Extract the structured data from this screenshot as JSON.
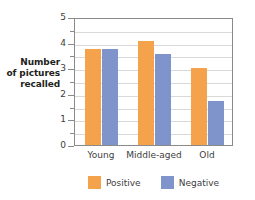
{
  "chart_data": {
    "type": "bar",
    "title": "",
    "xlabel": "",
    "ylabel": "Number of pictures recalled",
    "ylabel_lines": [
      "Number",
      "of pictures",
      "recalled"
    ],
    "categories": [
      "Young",
      "Middle-aged",
      "Old"
    ],
    "series": [
      {
        "name": "Positive",
        "color": "#f5a24c",
        "values": [
          3.75,
          4.05,
          3.0
        ]
      },
      {
        "name": "Negative",
        "color": "#8094cc",
        "values": [
          3.75,
          3.55,
          1.7
        ]
      }
    ],
    "ylim": [
      0,
      5
    ],
    "y_ticks": [
      0,
      1,
      2,
      3,
      4,
      5
    ],
    "y_tick_labels": [
      "0",
      "1",
      "2",
      "3",
      "4",
      "5"
    ],
    "y_minor_tick_step": 0.5,
    "grid": true,
    "grid_color": "#d9d9d9",
    "axis_color": "#8a8a8a",
    "legend_position": "bottom"
  },
  "legend": {
    "items": [
      {
        "label": "Positive",
        "color": "#f5a24c"
      },
      {
        "label": "Negative",
        "color": "#8094cc"
      }
    ]
  }
}
